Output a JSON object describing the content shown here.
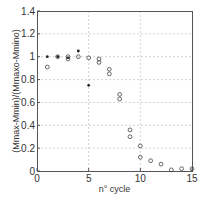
{
  "chart_data": {
    "type": "scatter",
    "title": "",
    "xlabel": "n° cycle",
    "ylabel": "(Mmax-Mmin)/(Mmaxo-Mmino)",
    "xlim": [
      0,
      15
    ],
    "ylim": [
      0,
      1.4
    ],
    "xticks": [
      0,
      5,
      10,
      15
    ],
    "xtick_labels": [
      "0",
      "5",
      "10",
      "15"
    ],
    "yticks": [
      0,
      0.2,
      0.4,
      0.6,
      0.8,
      1,
      1.2,
      1.4
    ],
    "ytick_labels": [
      "0",
      "0.2",
      "0.4",
      "0.6",
      "0.8",
      "1",
      "1.2",
      "1.4"
    ],
    "grid": true,
    "legend": null,
    "series": [
      {
        "name": "filled dots",
        "marker": "dot",
        "color": "#222222",
        "points": [
          {
            "x": 1,
            "y": 1.0
          },
          {
            "x": 2,
            "y": 1.0
          },
          {
            "x": 3,
            "y": 0.99
          },
          {
            "x": 4,
            "y": 1.05
          },
          {
            "x": 5,
            "y": 0.75
          }
        ]
      },
      {
        "name": "open circles",
        "marker": "circle",
        "color": "#444444",
        "points": [
          {
            "x": 1,
            "y": 0.91
          },
          {
            "x": 2,
            "y": 1.0
          },
          {
            "x": 3,
            "y": 1.0
          },
          {
            "x": 3,
            "y": 0.98
          },
          {
            "x": 4,
            "y": 1.0
          },
          {
            "x": 5,
            "y": 0.99
          },
          {
            "x": 6,
            "y": 0.98
          },
          {
            "x": 6,
            "y": 0.95
          },
          {
            "x": 7,
            "y": 0.89
          },
          {
            "x": 7,
            "y": 0.85
          },
          {
            "x": 8,
            "y": 0.67
          },
          {
            "x": 8,
            "y": 0.63
          },
          {
            "x": 9,
            "y": 0.36
          },
          {
            "x": 9,
            "y": 0.3
          },
          {
            "x": 10,
            "y": 0.22
          },
          {
            "x": 10,
            "y": 0.12
          },
          {
            "x": 11,
            "y": 0.09
          },
          {
            "x": 12,
            "y": 0.06
          },
          {
            "x": 13,
            "y": 0.01
          },
          {
            "x": 14,
            "y": 0.02
          },
          {
            "x": 15,
            "y": 0.02
          }
        ]
      }
    ]
  },
  "layout": {
    "plot": {
      "left": 37,
      "top": 11,
      "right": 192,
      "bottom": 171
    }
  }
}
